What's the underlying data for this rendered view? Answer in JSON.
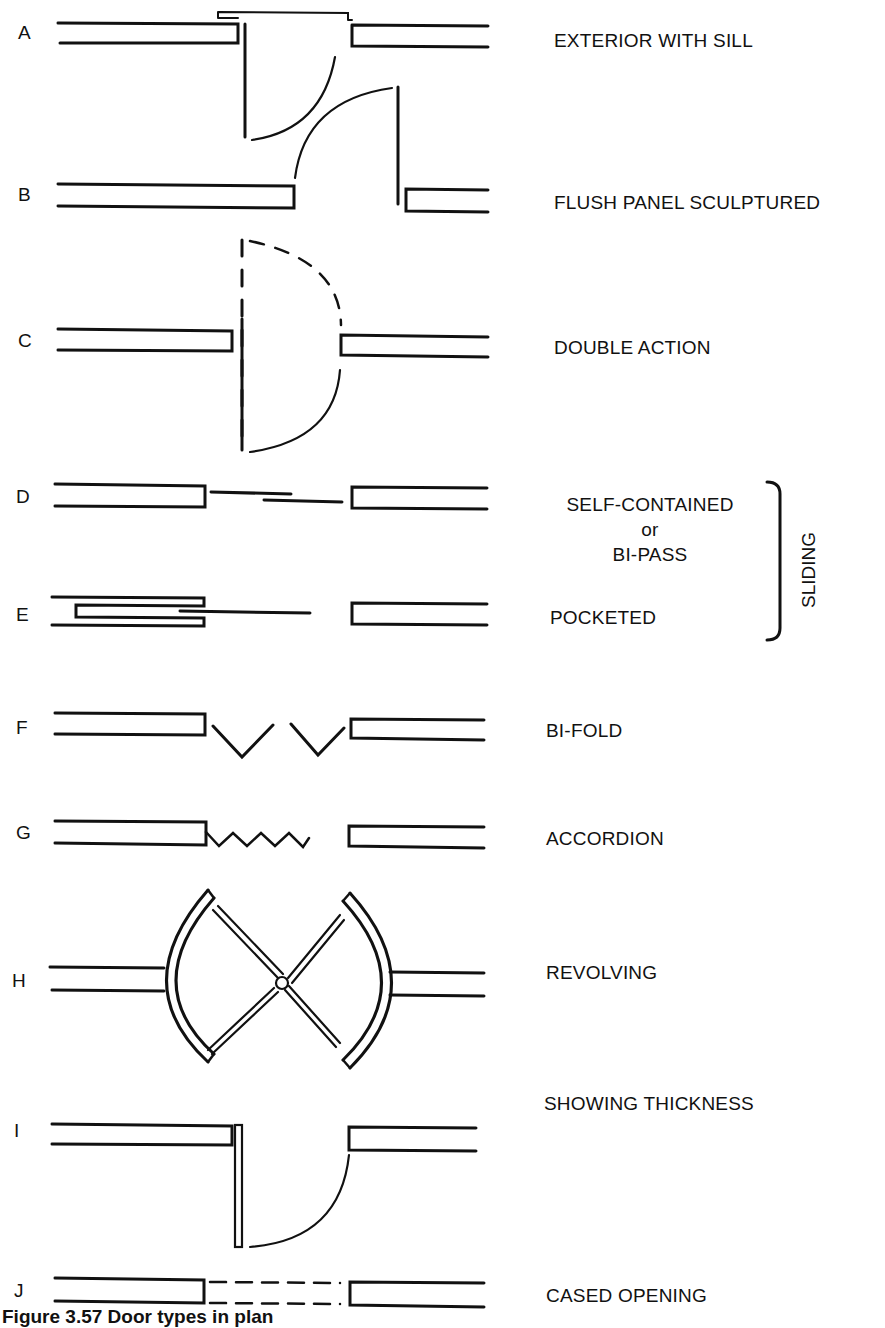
{
  "rows": [
    {
      "letter": "A",
      "label": "EXTERIOR WITH SILL"
    },
    {
      "letter": "B",
      "label": "FLUSH PANEL SCULPTURED"
    },
    {
      "letter": "C",
      "label": "DOUBLE ACTION"
    },
    {
      "letter": "D",
      "label": "SELF-CONTAINED",
      "label_line2": "or",
      "label_line3": "BI-PASS"
    },
    {
      "letter": "E",
      "label": "POCKETED"
    },
    {
      "letter": "F",
      "label": "BI-FOLD"
    },
    {
      "letter": "G",
      "label": "ACCORDION"
    },
    {
      "letter": "H",
      "label": "REVOLVING"
    },
    {
      "letter": "I",
      "label": "SHOWING THICKNESS"
    },
    {
      "letter": "J",
      "label": "CASED OPENING"
    }
  ],
  "group": {
    "label": "SLIDING"
  },
  "caption": "Figure 3.57  Door types in plan"
}
